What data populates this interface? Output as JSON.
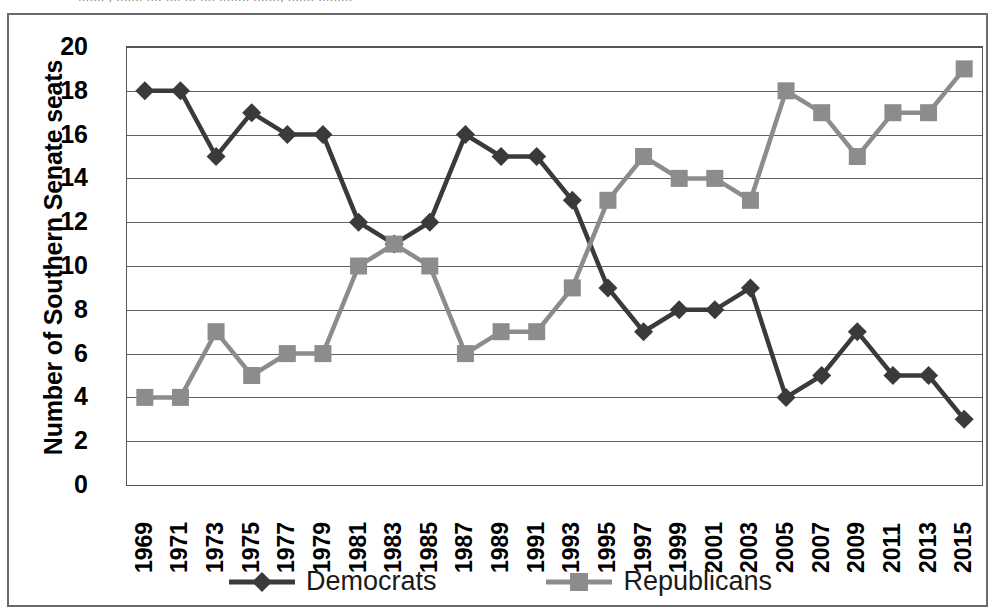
{
  "top_sliver_text": "....... , ....... .... .... ... .... ........ ......., ....... .........",
  "axes": {
    "y_title": "Number of Southern Senate seats",
    "y_ticks": [
      20,
      18,
      16,
      14,
      12,
      10,
      8,
      6,
      4,
      2,
      0
    ],
    "y_min": 0,
    "y_max": 20,
    "x_ticks": [
      "1969",
      "1971",
      "1973",
      "1975",
      "1977",
      "1979",
      "1981",
      "1983",
      "1985",
      "1987",
      "1989",
      "1991",
      "1993",
      "1995",
      "1997",
      "1999",
      "2001",
      "2003",
      "2005",
      "2007",
      "2009",
      "2011",
      "2013",
      "2015"
    ]
  },
  "legend": {
    "items": [
      {
        "label": "Democrats",
        "color": "#3a3a3a",
        "marker": "diamond"
      },
      {
        "label": "Republicans",
        "color": "#8c8c8c",
        "marker": "square"
      }
    ]
  },
  "colors": {
    "democrat": "#3a3a3a",
    "republican": "#8c8c8c",
    "grid": "#5f5f5f",
    "frame": "#6a6a6a",
    "text": "#000000",
    "background": "#ffffff"
  },
  "chart_data": {
    "type": "line",
    "title": "",
    "xlabel": "",
    "ylabel": "Number of Southern Senate seats",
    "ylim": [
      0,
      20
    ],
    "ytick_step": 2,
    "grid": true,
    "legend_position": "bottom",
    "categories": [
      "1969",
      "1971",
      "1973",
      "1975",
      "1977",
      "1979",
      "1981",
      "1983",
      "1985",
      "1987",
      "1989",
      "1991",
      "1993",
      "1995",
      "1997",
      "1999",
      "2001",
      "2003",
      "2005",
      "2007",
      "2009",
      "2011",
      "2013",
      "2015"
    ],
    "series": [
      {
        "name": "Democrats",
        "color": "#3a3a3a",
        "marker": "diamond",
        "values": [
          18,
          18,
          15,
          17,
          16,
          16,
          12,
          11,
          12,
          16,
          15,
          15,
          13,
          9,
          7,
          8,
          8,
          9,
          4,
          5,
          7,
          5,
          5,
          3
        ]
      },
      {
        "name": "Republicans",
        "color": "#8c8c8c",
        "marker": "square",
        "values": [
          4,
          4,
          7,
          5,
          6,
          6,
          10,
          11,
          10,
          6,
          7,
          7,
          9,
          13,
          15,
          14,
          14,
          13,
          18,
          17,
          15,
          17,
          17,
          19
        ]
      }
    ]
  }
}
